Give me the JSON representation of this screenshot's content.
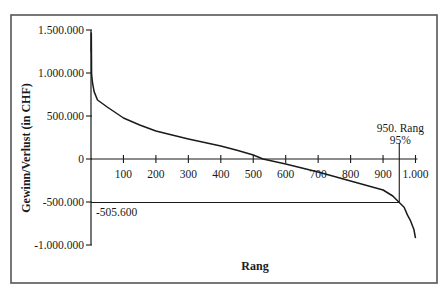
{
  "chart_data": {
    "type": "line",
    "title": "",
    "xlabel": "Rang",
    "ylabel": "Gewinn/Verlust (in CHF)",
    "xlim": [
      0,
      1000
    ],
    "ylim": [
      -1000000,
      1500000
    ],
    "grid": false,
    "legend": null,
    "x_ticks": [
      "100",
      "200",
      "300",
      "400",
      "500",
      "600",
      "700",
      "800",
      "900",
      "1.000"
    ],
    "y_ticks": [
      "1.500.000",
      "1.000.000",
      "500.000",
      "0",
      "-500.000",
      "-1.000.000"
    ],
    "series": [
      {
        "name": "Gewinn/Verlust",
        "x": [
          1,
          2,
          5,
          10,
          20,
          50,
          100,
          150,
          200,
          250,
          300,
          350,
          400,
          450,
          500,
          530,
          600,
          650,
          700,
          750,
          800,
          850,
          900,
          930,
          950,
          965,
          975,
          985,
          995,
          1000
        ],
        "values": [
          1465000,
          980000,
          880000,
          780000,
          686000,
          605000,
          477000,
          395000,
          326000,
          278000,
          233000,
          192000,
          151000,
          102000,
          47000,
          0,
          -58000,
          -105000,
          -151000,
          -203000,
          -256000,
          -308000,
          -360000,
          -430000,
          -505600,
          -560000,
          -650000,
          -720000,
          -820000,
          -920000
        ]
      }
    ],
    "annotations": [
      {
        "text": "-505.600",
        "x": 0,
        "y": -505600,
        "type": "horizontal-reference-line"
      },
      {
        "text": "950. Rang",
        "x": 950,
        "type": "vertical-reference-line"
      },
      {
        "text": "95%",
        "x": 950,
        "type": "vertical-reference-line-sublabel"
      }
    ]
  }
}
